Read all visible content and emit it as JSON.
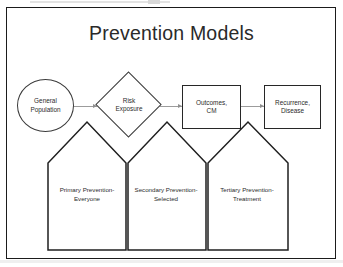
{
  "slide": {
    "title": "Prevention Models",
    "background_color": "#ffffff",
    "frame_color": "#1b1b1b"
  },
  "flow": {
    "connector_color": "#9c9c9c",
    "nodes": [
      {
        "id": "general-population",
        "shape": "circle",
        "label": "General\nPopulation"
      },
      {
        "id": "risk-exposure",
        "shape": "diamond",
        "label": "Risk\nExposure"
      },
      {
        "id": "outcomes-cm",
        "shape": "rectangle",
        "label": "Outcomes,\nCM"
      },
      {
        "id": "recurrence-disease",
        "shape": "rectangle",
        "label": "Recurrence,\nDisease"
      }
    ],
    "arrows": [
      {
        "from": "general-population",
        "to": "risk-exposure"
      },
      {
        "from": "risk-exposure",
        "to": "outcomes-cm"
      },
      {
        "from": "outcomes-cm",
        "to": "recurrence-disease"
      }
    ]
  },
  "prevention_levels": [
    {
      "id": "primary",
      "shape": "house",
      "label": "Primary Prevention-\nEveryone"
    },
    {
      "id": "secondary",
      "shape": "house",
      "label": "Secondary Prevention-\nSelected"
    },
    {
      "id": "tertiary",
      "shape": "house",
      "label": "Tertiary Prevention-\nTreatment"
    }
  ]
}
